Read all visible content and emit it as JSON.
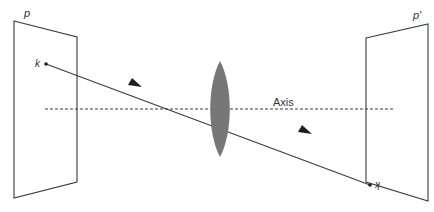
{
  "diagram": {
    "type": "optics-lens-imaging",
    "labels": {
      "object_plane": "p",
      "image_plane": "p'",
      "object_point": "k",
      "image_point": "k",
      "axis": "Axis"
    },
    "colors": {
      "line": "#3a3a3a",
      "lens": "#777777",
      "background": "#ffffff"
    },
    "object_plane": {
      "points": [
        [
          14,
          21
        ],
        [
          77,
          37
        ],
        [
          77,
          182
        ],
        [
          14,
          198
        ]
      ]
    },
    "image_plane": {
      "points": [
        [
          366,
          38
        ],
        [
          428,
          24
        ],
        [
          428,
          201
        ],
        [
          366,
          182
        ]
      ]
    },
    "lens": {
      "cx": 220,
      "cy": 109,
      "half_width": 11,
      "half_height": 48
    },
    "axis_line": {
      "x1": 45,
      "y1": 109,
      "x2": 395,
      "y2": 109
    },
    "ray": {
      "x1": 46,
      "y1": 64,
      "x2": 370,
      "y2": 185
    },
    "arrows": [
      {
        "x": 137,
        "y": 85
      },
      {
        "x": 307,
        "y": 132
      }
    ]
  }
}
